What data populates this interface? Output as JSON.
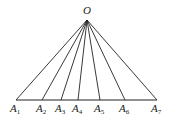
{
  "diagram": {
    "apex": {
      "label": "O",
      "x": 87,
      "y": 20
    },
    "baseline_y": 100,
    "points": [
      {
        "label": "A",
        "sub": "1",
        "x": 16
      },
      {
        "label": "A",
        "sub": "2",
        "x": 42
      },
      {
        "label": "A",
        "sub": "3",
        "x": 61
      },
      {
        "label": "A",
        "sub": "4",
        "x": 78
      },
      {
        "label": "A",
        "sub": "5",
        "x": 100
      },
      {
        "label": "A",
        "sub": "6",
        "x": 125
      },
      {
        "label": "A",
        "sub": "7",
        "x": 157
      }
    ],
    "stroke_color": "#222222"
  }
}
